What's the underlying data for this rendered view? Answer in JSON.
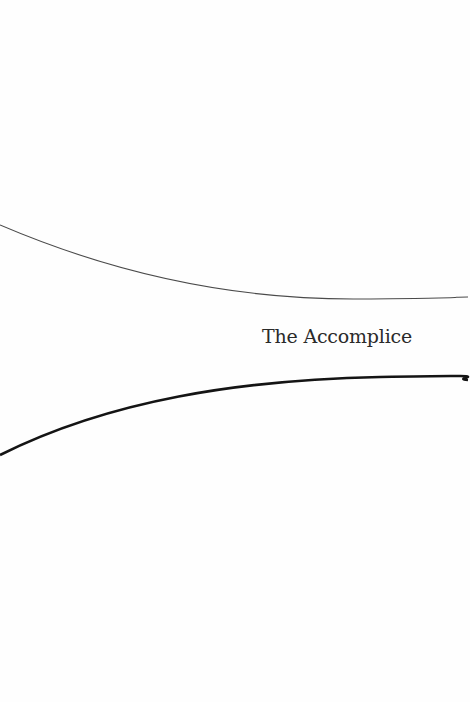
{
  "page": {
    "title": "The Accomplice"
  },
  "colors": {
    "background": "#fefefe",
    "upper_curve": "#4a4a4a",
    "lower_curve": "#141414",
    "title_text": "#2a2a2a"
  }
}
